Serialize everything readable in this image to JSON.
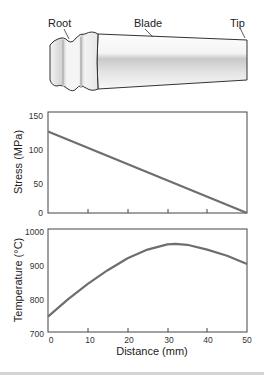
{
  "diagram": {
    "labels": {
      "root": "Root",
      "blade": "Blade",
      "tip": "Tip"
    }
  },
  "chart_data": [
    {
      "type": "line",
      "title": "",
      "xlabel": "",
      "ylabel": "Stress (MPa)",
      "xlim": [
        0,
        50
      ],
      "ylim": [
        0,
        150
      ],
      "yticks": [
        "0",
        "50",
        "100",
        "150"
      ],
      "xticks": [
        0,
        10,
        20,
        30,
        40,
        50
      ],
      "series": [
        {
          "name": "Stress",
          "x": [
            0,
            50
          ],
          "values": [
            121,
            0
          ]
        }
      ],
      "grid": false
    },
    {
      "type": "line",
      "title": "",
      "xlabel": "Distance (mm)",
      "ylabel": "Temperature (°C)",
      "xlim": [
        0,
        50
      ],
      "ylim": [
        700,
        1000
      ],
      "yticks": [
        "700",
        "800",
        "900",
        "1000"
      ],
      "xticks": [
        "0",
        "10",
        "20",
        "30",
        "40",
        "50"
      ],
      "series": [
        {
          "name": "Temperature",
          "x": [
            0,
            5,
            10,
            15,
            20,
            25,
            30,
            32,
            35,
            40,
            45,
            50
          ],
          "values": [
            745,
            795,
            840,
            880,
            915,
            940,
            955,
            957,
            954,
            940,
            922,
            898
          ]
        }
      ],
      "grid": false
    }
  ]
}
